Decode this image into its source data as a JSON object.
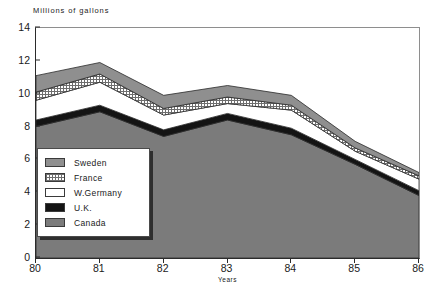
{
  "chart_data": {
    "type": "area",
    "stacked": true,
    "title": "",
    "subtitle": "",
    "ylabel": "Millions of gallons",
    "xlabel": "Years",
    "categories": [
      "80",
      "81",
      "82",
      "83",
      "84",
      "85",
      "86"
    ],
    "x": [
      80,
      81,
      82,
      83,
      84,
      85,
      86
    ],
    "ylim": [
      0,
      14
    ],
    "yticks": [
      0,
      2,
      4,
      6,
      8,
      10,
      12,
      14
    ],
    "grid": false,
    "legend_position": "inside-left",
    "series": [
      {
        "name": "Canada",
        "color": "#7b7b7b",
        "values": [
          8.0,
          8.9,
          7.4,
          8.4,
          7.5,
          5.7,
          3.8
        ]
      },
      {
        "name": "U.K.",
        "color": "#141414",
        "values": [
          0.4,
          0.4,
          0.4,
          0.4,
          0.4,
          0.3,
          0.3
        ]
      },
      {
        "name": "W.Germany",
        "color": "#ffffff",
        "values": [
          1.2,
          1.4,
          0.9,
          0.6,
          1.1,
          0.5,
          0.7
        ]
      },
      {
        "name": "France",
        "color": "#d4d4d4",
        "values": [
          0.5,
          0.5,
          0.4,
          0.4,
          0.3,
          0.2,
          0.2
        ]
      },
      {
        "name": "Sweden",
        "color": "#8f8f8f",
        "values": [
          1.0,
          0.7,
          0.8,
          0.7,
          0.6,
          0.4,
          0.2
        ]
      }
    ],
    "totals": [
      11.1,
      11.9,
      9.9,
      10.5,
      9.9,
      7.1,
      5.2
    ]
  },
  "legend": {
    "items": [
      {
        "label": "Sweden",
        "swatch": "sweden-swatch"
      },
      {
        "label": "France",
        "swatch": "france-swatch"
      },
      {
        "label": "W.Germany",
        "swatch": "wgermany-swatch"
      },
      {
        "label": "U.K.",
        "swatch": "uk-swatch"
      },
      {
        "label": "Canada",
        "swatch": "canada-swatch"
      }
    ]
  }
}
